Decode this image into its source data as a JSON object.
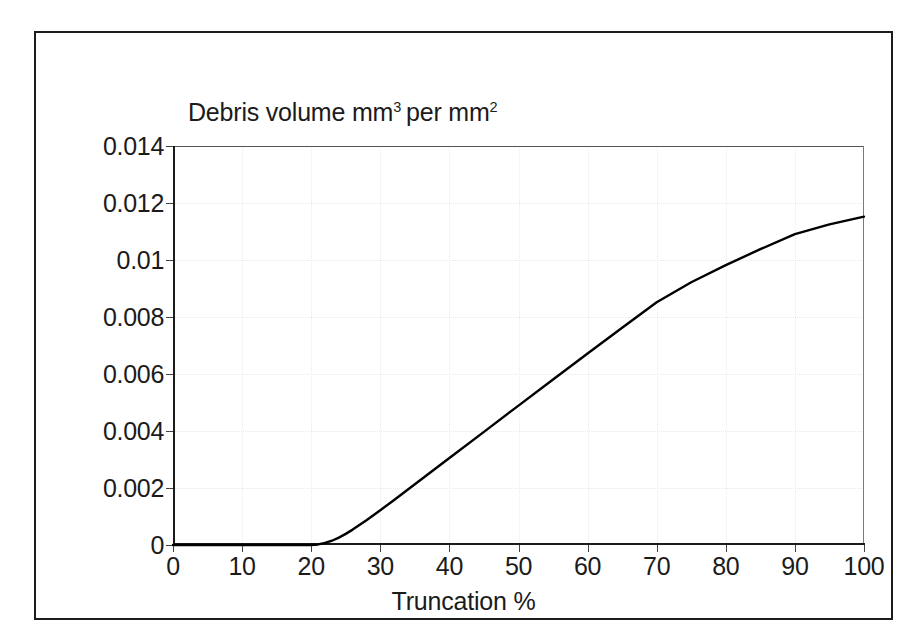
{
  "figure": {
    "background_color": "#ffffff",
    "frame_color": "#1c1c1c"
  },
  "chart_data": {
    "type": "line",
    "title_parts": {
      "lead": "Debris volume mm",
      "sup1": "3",
      "mid": "per mm",
      "sup2": "2"
    },
    "xlabel": "Truncation %",
    "ylabel": "Debris volume mm3 per mm2",
    "xlim": [
      0,
      100
    ],
    "ylim": [
      0,
      0.014
    ],
    "xticks": [
      0,
      10,
      20,
      30,
      40,
      50,
      60,
      70,
      80,
      90,
      100
    ],
    "xtick_labels": [
      "0",
      "10",
      "20",
      "30",
      "40",
      "50",
      "60",
      "70",
      "80",
      "90",
      "100"
    ],
    "yticks": [
      0,
      0.002,
      0.004,
      0.006,
      0.008,
      0.01,
      0.012,
      0.014
    ],
    "ytick_labels": [
      "0",
      "0.002",
      "0.004",
      "0.006",
      "0.008",
      "0.01",
      "0.012",
      "0.014"
    ],
    "grid": true,
    "grid_style": "dotted",
    "grid_color": "#eaeaea",
    "legend": false,
    "legend_position": "none",
    "series": [
      {
        "name": "Debris volume",
        "color": "#000000",
        "line_width": 2.4,
        "x": [
          0,
          5,
          10,
          15,
          18,
          20,
          21,
          22,
          23,
          24,
          25,
          26,
          28,
          30,
          32,
          35,
          40,
          45,
          50,
          55,
          60,
          65,
          70,
          75,
          80,
          85,
          90,
          95,
          100
        ],
        "y": [
          0,
          0,
          0,
          0,
          0,
          0,
          2e-05,
          7e-05,
          0.00015,
          0.00026,
          0.00039,
          0.00054,
          0.00087,
          0.00122,
          0.00158,
          0.00213,
          0.00305,
          0.00397,
          0.00489,
          0.00581,
          0.00672,
          0.00762,
          0.00852,
          0.00922,
          0.00982,
          0.01038,
          0.01091,
          0.01125,
          0.01152
        ]
      }
    ],
    "annotations": []
  }
}
